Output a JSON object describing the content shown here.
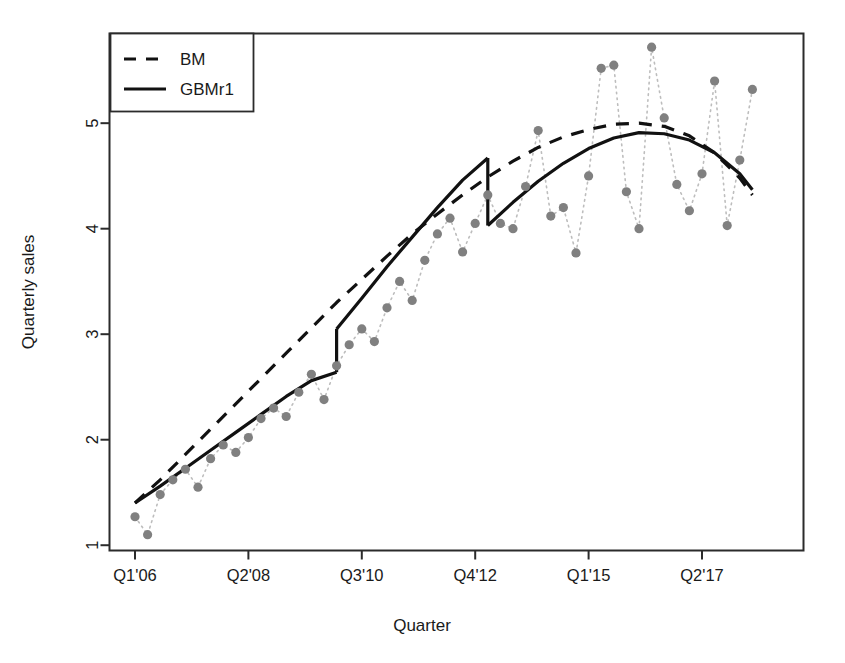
{
  "chart_data": {
    "type": "line",
    "title": "",
    "xlabel": "Quarter",
    "ylabel": "Quarterly sales",
    "grid": false,
    "legend_position": "top-left",
    "xlim_index": [
      0,
      50
    ],
    "ylim": [
      0.95,
      5.85
    ],
    "ytick_values": [
      1,
      2,
      3,
      4,
      5
    ],
    "ytick_labels": [
      "1",
      "2",
      "3",
      "4",
      "5"
    ],
    "xtick_indices": [
      0,
      9,
      18,
      27,
      36,
      45
    ],
    "xtick_labels": [
      "Q1'06",
      "Q2'08",
      "Q3'10",
      "Q4'12",
      "Q1'15",
      "Q2'17"
    ],
    "legend": [
      {
        "name": "BM",
        "style": "dashed"
      },
      {
        "name": "GBMr1",
        "style": "solid"
      }
    ],
    "series": [
      {
        "name": "observed",
        "style": "points-dotted",
        "color": "#808080",
        "x": [
          0,
          1,
          2,
          3,
          4,
          5,
          6,
          7,
          8,
          9,
          10,
          11,
          12,
          13,
          14,
          15,
          16,
          17,
          18,
          19,
          20,
          21,
          22,
          23,
          24,
          25,
          26,
          27,
          28,
          29,
          30,
          31,
          32,
          33,
          34,
          35,
          36,
          37,
          38,
          39,
          40,
          41,
          42,
          43,
          44,
          45,
          46,
          47,
          48,
          49
        ],
        "values": [
          1.27,
          1.1,
          1.48,
          1.62,
          1.72,
          1.55,
          1.82,
          1.95,
          1.88,
          2.02,
          2.2,
          2.3,
          2.22,
          2.45,
          2.62,
          2.38,
          2.7,
          2.9,
          3.05,
          2.93,
          3.25,
          3.5,
          3.32,
          3.7,
          3.95,
          4.1,
          3.78,
          4.05,
          4.32,
          4.05,
          4.0,
          4.4,
          4.93,
          4.12,
          4.2,
          3.77,
          4.5,
          5.52,
          5.55,
          4.35,
          4.0,
          5.72,
          5.05,
          4.42,
          4.17,
          4.52,
          5.4,
          4.03,
          4.65,
          5.32
        ]
      },
      {
        "name": "BM",
        "style": "dashed",
        "color": "#111111",
        "x": [
          0,
          2,
          4,
          6,
          8,
          10,
          12,
          14,
          16,
          18,
          20,
          22,
          24,
          26,
          28,
          30,
          32,
          34,
          36,
          38,
          40,
          42,
          44,
          46,
          48,
          49
        ],
        "values": [
          1.4,
          1.62,
          1.86,
          2.1,
          2.34,
          2.58,
          2.82,
          3.06,
          3.3,
          3.52,
          3.74,
          3.95,
          4.14,
          4.32,
          4.49,
          4.64,
          4.77,
          4.87,
          4.94,
          4.99,
          5.0,
          4.97,
          4.88,
          4.72,
          4.48,
          4.32
        ]
      },
      {
        "name": "GBMr1",
        "style": "solid-piecewise",
        "color": "#111111",
        "segments": [
          {
            "x": [
              0,
              2,
              4,
              6,
              8,
              10,
              12,
              14,
              16
            ],
            "values": [
              1.4,
              1.56,
              1.73,
              1.9,
              2.07,
              2.24,
              2.41,
              2.56,
              2.64
            ]
          },
          {
            "x": [
              16,
              18,
              20,
              22,
              24,
              26,
              28
            ],
            "values": [
              3.05,
              3.34,
              3.64,
              3.92,
              4.2,
              4.46,
              4.67
            ]
          },
          {
            "x": [
              28,
              30,
              32,
              34,
              36,
              38,
              40,
              42,
              44,
              46,
              48,
              49
            ],
            "values": [
              4.03,
              4.25,
              4.45,
              4.62,
              4.76,
              4.86,
              4.91,
              4.9,
              4.84,
              4.72,
              4.52,
              4.37
            ]
          }
        ],
        "jumps": [
          {
            "x": 16,
            "from": 2.64,
            "to": 3.05,
            "direction": "up"
          },
          {
            "x": 28,
            "from": 4.67,
            "to": 4.03,
            "direction": "down"
          }
        ]
      }
    ]
  },
  "axes": {
    "y_title": "Quarterly sales",
    "x_title": "Quarter",
    "y_ticks": [
      "1",
      "2",
      "3",
      "4",
      "5"
    ],
    "x_ticks": [
      "Q1'06",
      "Q2'08",
      "Q3'10",
      "Q4'12",
      "Q1'15",
      "Q2'17"
    ]
  },
  "legend": {
    "items": [
      {
        "label": "BM"
      },
      {
        "label": "GBMr1"
      }
    ]
  },
  "colors": {
    "line": "#111111",
    "points": "#808080",
    "dotted_connector": "#bdbdbd",
    "frame": "#2b2b2b",
    "background": "#ffffff"
  }
}
